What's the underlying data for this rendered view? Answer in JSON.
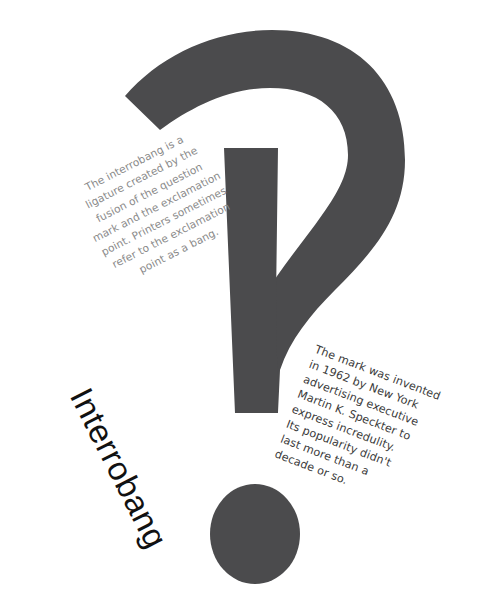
{
  "title": "Interrobang",
  "glyph": {
    "icon": "interrobang-glyph",
    "color": "#4b4b4d"
  },
  "left_paragraph": "The interrobang is a\nligature created by the\nfusion of the question\nmark and the exclamation\npoint. Printers sometimes\nrefer to the exclamation\npoint as a bang.",
  "right_paragraph": "The mark was invented\nin 1962 by New York\nadvertising executive\nMartin K. Speckter to\nexpress incredulity.\nIts popularity didn't\nlast more than a\ndecade or so.",
  "colors": {
    "background": "#ffffff",
    "left_text": "#8a8a8a",
    "right_text": "#3a3a3a",
    "title_text": "#111111"
  }
}
